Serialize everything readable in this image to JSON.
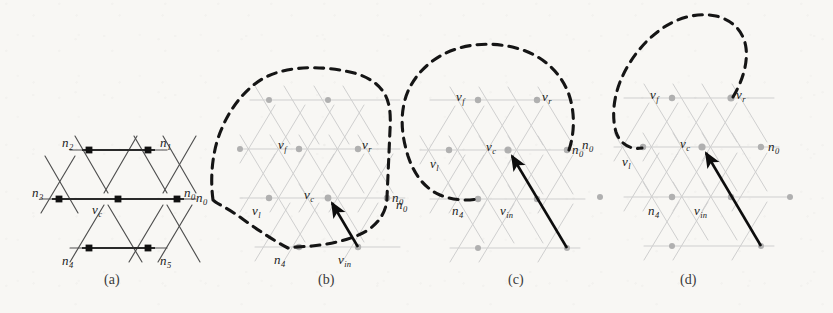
{
  "figure": {
    "background_color": "#f8f7f4",
    "ink_color": "#1b1b1b",
    "lattice_color_dark": "#4a4a4a",
    "lattice_color_light": "#c9c9c9",
    "node_color_dark": "#111111",
    "node_color_light": "#a9a9a9",
    "dashed_color": "#151515",
    "arrow_color": "#0d0d0d"
  },
  "panels": [
    {
      "id": "a",
      "caption": "(a)",
      "caption_x": 104,
      "caption_y": 273,
      "style": "dark",
      "labels": [
        {
          "name": "label-n2",
          "base": "n",
          "sub": "2",
          "x": 62,
          "y": 136
        },
        {
          "name": "label-n1",
          "base": "n",
          "sub": "1",
          "x": 160,
          "y": 136
        },
        {
          "name": "label-n3",
          "base": "n",
          "sub": "3",
          "x": 32,
          "y": 186
        },
        {
          "name": "label-vc",
          "base": "v",
          "sub": "c",
          "x": 92,
          "y": 203
        },
        {
          "name": "label-n0",
          "base": "n",
          "sub": "0",
          "x": 184,
          "y": 186
        },
        {
          "name": "label-n4",
          "base": "n",
          "sub": "4",
          "x": 62,
          "y": 254
        },
        {
          "name": "label-n5",
          "base": "n",
          "sub": "5",
          "x": 160,
          "y": 254
        }
      ]
    },
    {
      "id": "b",
      "caption": "(b)",
      "caption_x": 318,
      "caption_y": 273,
      "style": "light",
      "labels": [
        {
          "name": "label-vf",
          "base": "v",
          "sub": "f",
          "x": 278,
          "y": 138
        },
        {
          "name": "label-vr",
          "base": "v",
          "sub": "r",
          "x": 362,
          "y": 138
        },
        {
          "name": "label-n0-left",
          "base": "n",
          "sub": "0",
          "x": 196,
          "y": 191
        },
        {
          "name": "label-vl",
          "base": "v",
          "sub": "l",
          "x": 252,
          "y": 204
        },
        {
          "name": "label-vc",
          "base": "v",
          "sub": "c",
          "x": 304,
          "y": 188
        },
        {
          "name": "label-n0-right",
          "base": "n",
          "sub": "0",
          "x": 392,
          "y": 191
        },
        {
          "name": "label-n4",
          "base": "n",
          "sub": "4",
          "x": 274,
          "y": 253
        },
        {
          "name": "label-vin",
          "base": "v",
          "sub": "in",
          "x": 338,
          "y": 253
        }
      ]
    },
    {
      "id": "c",
      "caption": "(c)",
      "caption_x": 508,
      "caption_y": 273,
      "style": "light",
      "labels": [
        {
          "name": "label-vf",
          "base": "v",
          "sub": "f",
          "x": 456,
          "y": 90
        },
        {
          "name": "label-vr",
          "base": "v",
          "sub": "r",
          "x": 542,
          "y": 90
        },
        {
          "name": "label-n0-left",
          "base": "n",
          "sub": "0",
          "x": 396,
          "y": 198
        },
        {
          "name": "label-vl",
          "base": "v",
          "sub": "l",
          "x": 430,
          "y": 157
        },
        {
          "name": "label-vc",
          "base": "v",
          "sub": "c",
          "x": 486,
          "y": 140
        },
        {
          "name": "label-n0-right",
          "base": "n",
          "sub": "0",
          "x": 572,
          "y": 143
        },
        {
          "name": "label-n4",
          "base": "n",
          "sub": "4",
          "x": 452,
          "y": 204
        },
        {
          "name": "label-vin",
          "base": "v",
          "sub": "in",
          "x": 500,
          "y": 204
        }
      ]
    },
    {
      "id": "d",
      "caption": "(d)",
      "caption_x": 680,
      "caption_y": 273,
      "style": "light",
      "labels": [
        {
          "name": "label-vf",
          "base": "v",
          "sub": "f",
          "x": 650,
          "y": 88
        },
        {
          "name": "label-vr",
          "base": "v",
          "sub": "r",
          "x": 736,
          "y": 88
        },
        {
          "name": "label-n0-left",
          "base": "n",
          "sub": "0",
          "x": 582,
          "y": 138
        },
        {
          "name": "label-vl",
          "base": "v",
          "sub": "l",
          "x": 622,
          "y": 155
        },
        {
          "name": "label-vc",
          "base": "v",
          "sub": "c",
          "x": 680,
          "y": 137
        },
        {
          "name": "label-n0-right",
          "base": "n",
          "sub": "0",
          "x": 768,
          "y": 140
        },
        {
          "name": "label-n4",
          "base": "n",
          "sub": "4",
          "x": 648,
          "y": 204
        },
        {
          "name": "label-vin",
          "base": "v",
          "sub": "in",
          "x": 694,
          "y": 204
        }
      ]
    }
  ],
  "diagram_geometry": {
    "description": "triangular lattice neighbourhood diagrams with dashed region boundaries and incoming direction arrows",
    "lattice_spacing_x": 59,
    "lattice_spacing_y": 49,
    "panel_a": {
      "nodes": [
        {
          "name": "vc",
          "x": 118,
          "y": 199
        },
        {
          "name": "n0",
          "x": 177,
          "y": 199
        },
        {
          "name": "n1",
          "x": 148,
          "y": 150
        },
        {
          "name": "n2",
          "x": 89,
          "y": 150
        },
        {
          "name": "n3",
          "x": 59,
          "y": 199
        },
        {
          "name": "n4",
          "x": 89,
          "y": 248
        },
        {
          "name": "n5",
          "x": 148,
          "y": 248
        }
      ]
    },
    "panel_b": {
      "center": {
        "x": 328,
        "y": 198
      },
      "nodes": [
        {
          "name": "vl",
          "x": 269,
          "y": 198
        },
        {
          "name": "n0",
          "x": 387,
          "y": 198
        },
        {
          "name": "vf",
          "x": 299,
          "y": 149
        },
        {
          "name": "vr",
          "x": 358,
          "y": 149
        },
        {
          "name": "n4",
          "x": 299,
          "y": 247
        },
        {
          "name": "vin",
          "x": 358,
          "y": 247
        }
      ],
      "arrow": {
        "x1": 358,
        "y1": 247,
        "x2": 328,
        "y2": 198
      }
    },
    "panel_c": {
      "center": {
        "x": 508,
        "y": 150
      },
      "nodes": [
        {
          "name": "vl",
          "x": 449,
          "y": 150
        },
        {
          "name": "n0",
          "x": 567,
          "y": 150
        },
        {
          "name": "vf",
          "x": 478,
          "y": 100
        },
        {
          "name": "vr",
          "x": 537,
          "y": 100
        },
        {
          "name": "n4",
          "x": 478,
          "y": 199
        },
        {
          "name": "vin",
          "x": 537,
          "y": 199
        }
      ],
      "arrow": {
        "x1": 567,
        "y1": 248,
        "x2": 508,
        "y2": 150
      }
    },
    "panel_d": {
      "center": {
        "x": 702,
        "y": 147
      },
      "nodes": [
        {
          "name": "vl",
          "x": 643,
          "y": 147
        },
        {
          "name": "n0",
          "x": 761,
          "y": 147
        },
        {
          "name": "vf",
          "x": 672,
          "y": 98
        },
        {
          "name": "vr",
          "x": 731,
          "y": 98
        },
        {
          "name": "n4",
          "x": 672,
          "y": 197
        },
        {
          "name": "vin",
          "x": 731,
          "y": 197
        }
      ],
      "arrow": {
        "x1": 761,
        "y1": 246,
        "x2": 702,
        "y2": 147
      }
    }
  }
}
